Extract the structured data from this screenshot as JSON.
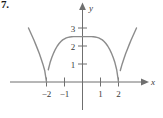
{
  "figure": {
    "number_label": "7."
  },
  "chart_data": {
    "type": "line",
    "title": "",
    "xlabel": "x",
    "ylabel": "y",
    "xlim": [
      -3.05,
      3.05
    ],
    "ylim": [
      -0.9,
      3.55
    ],
    "grid": false,
    "legend": null,
    "xticks": [
      -2,
      -1,
      1,
      2
    ],
    "xtick_labels": [
      "−2",
      "−1",
      "1",
      "2"
    ],
    "yticks": [
      1,
      2,
      3
    ],
    "ytick_labels": [
      "1",
      "2",
      "3"
    ],
    "axis_arrows": {
      "x": "right",
      "y": "up"
    },
    "series": [
      {
        "name": "curve",
        "color": "#8c8c8c",
        "description": "Three arches with cusps on the x-axis at x = -2 and x = 2; central arch peaks near y = 2.5 at x = 0; outer branches rise steeply away from the cusps.",
        "cusp_points": [
          {
            "x": -2,
            "y": 0
          },
          {
            "x": 2,
            "y": 0
          }
        ],
        "peak_point": {
          "x": 0,
          "y": 2.5
        },
        "x": [
          -3.0,
          -2.9,
          -2.8,
          -2.7,
          -2.6,
          -2.5,
          -2.4,
          -2.3,
          -2.2,
          -2.1,
          -2.0,
          -1.9,
          -1.8,
          -1.7,
          -1.6,
          -1.5,
          -1.4,
          -1.3,
          -1.2,
          -1.1,
          -1.0,
          -0.9,
          -0.8,
          -0.7,
          -0.6,
          -0.5,
          -0.4,
          -0.3,
          -0.2,
          -0.1,
          0.0,
          0.1,
          0.2,
          0.3,
          0.4,
          0.5,
          0.6,
          0.7,
          0.8,
          0.9,
          1.0,
          1.1,
          1.2,
          1.3,
          1.4,
          1.5,
          1.6,
          1.7,
          1.8,
          1.9,
          2.0,
          2.1,
          2.2,
          2.3,
          2.4,
          2.5,
          2.6,
          2.7,
          2.8,
          2.9,
          3.0
        ],
        "y": [
          3.0,
          2.78,
          2.56,
          2.33,
          2.09,
          1.84,
          1.58,
          1.29,
          0.99,
          0.64,
          0.0,
          0.68,
          1.08,
          1.38,
          1.62,
          1.83,
          2.0,
          2.14,
          2.25,
          2.34,
          2.4,
          2.45,
          2.48,
          2.5,
          2.51,
          2.52,
          2.52,
          2.52,
          2.52,
          2.52,
          2.52,
          2.52,
          2.52,
          2.52,
          2.52,
          2.52,
          2.51,
          2.5,
          2.48,
          2.45,
          2.4,
          2.34,
          2.25,
          2.14,
          2.0,
          1.83,
          1.62,
          1.38,
          1.08,
          0.68,
          0.0,
          0.64,
          0.99,
          1.29,
          1.58,
          1.84,
          2.09,
          2.33,
          2.56,
          2.78,
          3.0
        ]
      }
    ]
  },
  "colors": {
    "curve": "#8c8c8c",
    "axis": "#6f6f6f",
    "text": "#3a3a3a",
    "background": "#ffffff"
  }
}
